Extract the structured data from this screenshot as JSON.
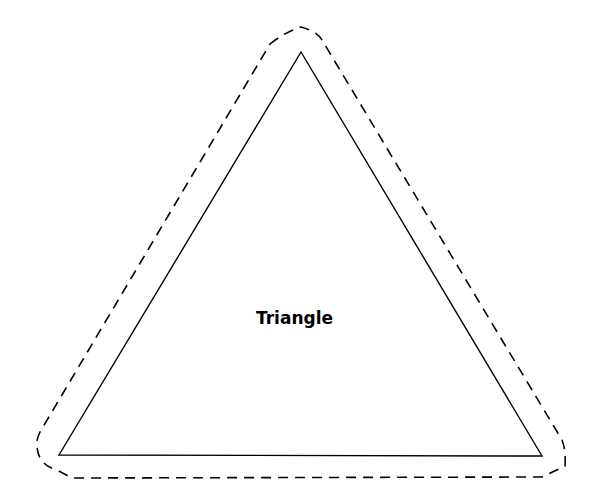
{
  "diagram": {
    "shape_label": "Triangle",
    "inner_triangle": {
      "points": "301,52 59,455 542,456",
      "stroke": "#000000",
      "style": "solid"
    },
    "outer_outline": {
      "points": "285,36 301,27 320,38 564,448 562,466 540,477 71,478 38,467 36,446 281,42",
      "stroke": "#000000",
      "style": "dashed"
    }
  }
}
